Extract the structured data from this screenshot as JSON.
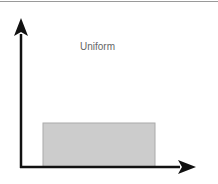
{
  "diagram": {
    "title": "Uniform",
    "colors": {
      "axis": "#111111",
      "box_fill": "#cccccc",
      "box_stroke": "#aaaaaa",
      "label": "#666666",
      "top_rule": "#9a9a9a"
    }
  }
}
